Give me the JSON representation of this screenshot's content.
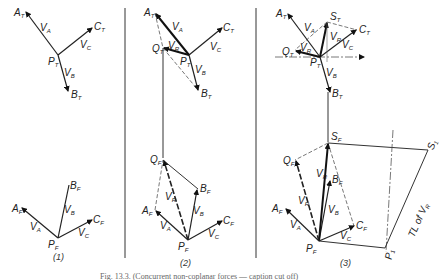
{
  "figure": {
    "caption_partial": "Fig. 13.3. (Concurrent non-coplanar forces — caption cut off)",
    "panels": [
      {
        "id": "1",
        "label": "(1)",
        "top_view": {
          "points": {
            "A": "A",
            "B": "B",
            "C": "C",
            "P": "P"
          },
          "subscript": "T",
          "vectors": [
            "V_A",
            "V_B",
            "V_C"
          ]
        },
        "front_view": {
          "points": {
            "A": "A",
            "B": "B",
            "C": "C",
            "P": "P"
          },
          "subscript": "F",
          "vectors": [
            "V_A",
            "V_B",
            "V_C"
          ]
        }
      },
      {
        "id": "2",
        "label": "(2)",
        "top_view": {
          "points": {
            "A": "A",
            "B": "B",
            "C": "C",
            "P": "P",
            "Q": "Q"
          },
          "subscript": "T",
          "vectors": [
            "V_A",
            "V_R",
            "V_B",
            "V_C"
          ]
        },
        "front_view": {
          "points": {
            "A": "A",
            "B": "B",
            "C": "C",
            "P": "P",
            "Q": "Q"
          },
          "subscript": "F",
          "vectors": [
            "V_A",
            "V_R",
            "V_B",
            "V_C"
          ]
        }
      },
      {
        "id": "3",
        "label": "(3)",
        "top_view": {
          "points": {
            "A": "A",
            "S": "S",
            "C": "C",
            "Q": "Q",
            "P": "P",
            "B": "B"
          },
          "subscript": "T",
          "vectors": [
            "V_A",
            "V_R",
            "V_C",
            "V_R'",
            "V_B"
          ]
        },
        "front_view": {
          "points": {
            "S": "S",
            "Q": "Q",
            "B": "B",
            "A": "A",
            "C": "C",
            "P": "P"
          },
          "subscript": "F",
          "vectors": [
            "V_R",
            "V_R'",
            "V_B",
            "V_A",
            "V_C"
          ]
        },
        "true_length": {
          "points": {
            "P1": "P",
            "S1": "S"
          },
          "subscript": "1",
          "annotation": "TL of V",
          "annotation_sub": "R"
        }
      }
    ],
    "letters": {
      "V": "V",
      "A": "A",
      "B": "B",
      "C": "C",
      "R": "R",
      "P": "P",
      "Q": "Q",
      "S": "S",
      "T": "T",
      "F": "F",
      "one": "1"
    }
  }
}
